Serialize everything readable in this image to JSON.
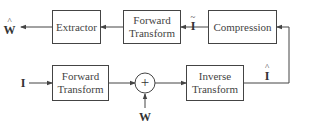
{
  "diagram": {
    "blocks": {
      "extractor": "Extractor",
      "forward_transform_top_line1": "Forward",
      "forward_transform_top_line2": "Transform",
      "compression": "Compression",
      "forward_transform_bottom_line1": "Forward",
      "forward_transform_bottom_line2": "Transform",
      "inverse_transform_line1": "Inverse",
      "inverse_transform_line2": "Transform"
    },
    "signals": {
      "w_hat": "W",
      "w_hat_accent": "^",
      "i_tilde": "I",
      "i_tilde_accent": "~",
      "i_input": "I",
      "w_input": "W",
      "i_hat": "I",
      "i_hat_accent": "^"
    },
    "summing_node": "+",
    "colors": {
      "stroke": "#444444",
      "background": "#ffffff"
    }
  }
}
